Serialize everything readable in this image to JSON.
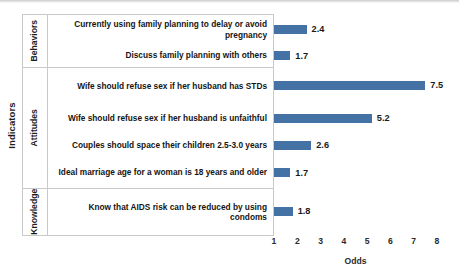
{
  "chart_data": {
    "type": "bar",
    "orientation": "horizontal",
    "title": "",
    "xlabel": "Odds",
    "ylabel": "Indicators",
    "xlim": [
      1,
      8
    ],
    "xticks": [
      1,
      2,
      3,
      4,
      5,
      6,
      7,
      8
    ],
    "grid": false,
    "legend": false,
    "bar_color": "#4472A4",
    "baseline": 1,
    "groups": [
      {
        "name": "Behaviors",
        "categories": [
          "Currently using family planning to delay or avoid pregnancy",
          "Discuss family planning with others"
        ],
        "values": [
          2.4,
          1.7
        ]
      },
      {
        "name": "Attitudes",
        "categories": [
          "Wife should refuse sex if her husband has STDs",
          "Wife should refuse sex if her husband is unfaithful",
          "Couples should space their children 2.5-3.0 years",
          "Ideal marriage age for a woman is 18 years and older"
        ],
        "values": [
          7.5,
          5.2,
          2.6,
          1.7
        ]
      },
      {
        "name": "Knowledge",
        "categories": [
          "Know that AIDS risk can be reduced by using condoms"
        ],
        "values": [
          1.8
        ]
      }
    ],
    "categories": [
      "Currently using family planning to delay or avoid pregnancy",
      "Discuss family planning with others",
      "Wife should refuse sex if her husband has STDs",
      "Wife should refuse sex if her husband is unfaithful",
      "Couples should space their children 2.5-3.0 years",
      "Ideal marriage age for a woman is 18 years and older",
      "Know that AIDS risk can be reduced by using condoms"
    ],
    "values": [
      2.4,
      1.7,
      7.5,
      5.2,
      2.6,
      1.7,
      1.8
    ],
    "value_labels": [
      "2.4",
      "1.7",
      "7.5",
      "5.2",
      "2.6",
      "1.7",
      "1.8"
    ]
  }
}
